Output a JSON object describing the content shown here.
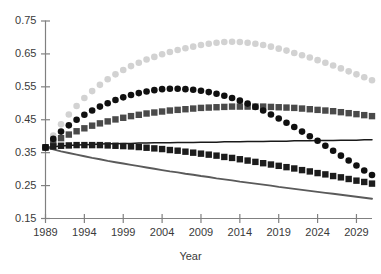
{
  "chart_data": {
    "type": "line",
    "title": "",
    "subtitle": "",
    "xlabel": "Year",
    "ylabel": "",
    "xlim": [
      1989,
      2031
    ],
    "ylim": [
      0.15,
      0.75
    ],
    "xticks": [
      1989,
      1994,
      1999,
      2004,
      2009,
      2014,
      2019,
      2024,
      2029
    ],
    "yticks": [
      0.15,
      0.25,
      0.35,
      0.45,
      0.55,
      0.65,
      0.75
    ],
    "xtick_labels": [
      "1989",
      "1994",
      "1999",
      "2004",
      "2009",
      "2014",
      "2019",
      "2024",
      "2029"
    ],
    "ytick_labels": [
      "0.15",
      "0.25",
      "0.35",
      "0.45",
      "0.55",
      "0.65",
      "0.75"
    ],
    "grid": false,
    "legend": "none",
    "x": [
      1989,
      1990,
      1991,
      1992,
      1993,
      1994,
      1995,
      1996,
      1997,
      1998,
      1999,
      2000,
      2001,
      2002,
      2003,
      2004,
      2005,
      2006,
      2007,
      2008,
      2009,
      2010,
      2011,
      2012,
      2013,
      2014,
      2015,
      2016,
      2017,
      2018,
      2019,
      2020,
      2021,
      2022,
      2023,
      2024,
      2025,
      2026,
      2027,
      2028,
      2029,
      2030,
      2031
    ],
    "series": [
      {
        "name": "light-gray-circles",
        "marker": "circle",
        "color": "#d2d2d2",
        "line": false,
        "values": [
          0.366,
          0.402,
          0.436,
          0.466,
          0.492,
          0.516,
          0.537,
          0.556,
          0.573,
          0.588,
          0.601,
          0.613,
          0.623,
          0.633,
          0.641,
          0.649,
          0.656,
          0.662,
          0.667,
          0.672,
          0.677,
          0.681,
          0.684,
          0.686,
          0.687,
          0.686,
          0.684,
          0.681,
          0.677,
          0.672,
          0.666,
          0.66,
          0.653,
          0.646,
          0.639,
          0.631,
          0.623,
          0.615,
          0.606,
          0.597,
          0.588,
          0.579,
          0.57
        ]
      },
      {
        "name": "black-circles",
        "marker": "circle",
        "color": "#101010",
        "line": false,
        "values": [
          0.366,
          0.392,
          0.414,
          0.433,
          0.45,
          0.465,
          0.478,
          0.49,
          0.5,
          0.51,
          0.518,
          0.525,
          0.531,
          0.536,
          0.54,
          0.543,
          0.544,
          0.544,
          0.543,
          0.541,
          0.538,
          0.534,
          0.529,
          0.523,
          0.516,
          0.508,
          0.499,
          0.489,
          0.478,
          0.466,
          0.454,
          0.441,
          0.428,
          0.414,
          0.4,
          0.386,
          0.371,
          0.356,
          0.341,
          0.326,
          0.311,
          0.296,
          0.282
        ]
      },
      {
        "name": "dark-gray-squares",
        "marker": "square",
        "color": "#4a4a4a",
        "line": false,
        "values": [
          0.366,
          0.381,
          0.394,
          0.405,
          0.415,
          0.424,
          0.432,
          0.439,
          0.445,
          0.451,
          0.456,
          0.461,
          0.465,
          0.469,
          0.472,
          0.475,
          0.478,
          0.48,
          0.482,
          0.484,
          0.486,
          0.487,
          0.488,
          0.489,
          0.49,
          0.49,
          0.49,
          0.49,
          0.49,
          0.489,
          0.488,
          0.487,
          0.486,
          0.484,
          0.482,
          0.48,
          0.478,
          0.476,
          0.473,
          0.47,
          0.467,
          0.464,
          0.461
        ]
      },
      {
        "name": "black-squares",
        "marker": "square",
        "color": "#1c1c1c",
        "line": false,
        "values": [
          0.366,
          0.369,
          0.371,
          0.372,
          0.373,
          0.373,
          0.373,
          0.373,
          0.372,
          0.371,
          0.37,
          0.369,
          0.367,
          0.365,
          0.363,
          0.361,
          0.358,
          0.356,
          0.353,
          0.35,
          0.347,
          0.344,
          0.341,
          0.337,
          0.334,
          0.33,
          0.326,
          0.322,
          0.318,
          0.314,
          0.31,
          0.306,
          0.302,
          0.297,
          0.293,
          0.288,
          0.284,
          0.279,
          0.275,
          0.27,
          0.265,
          0.261,
          0.256
        ]
      },
      {
        "name": "thin-black-line",
        "marker": "none",
        "color": "#1a1a1a",
        "line": true,
        "values": [
          0.366,
          0.368,
          0.37,
          0.372,
          0.373,
          0.374,
          0.375,
          0.376,
          0.377,
          0.377,
          0.378,
          0.378,
          0.379,
          0.379,
          0.38,
          0.38,
          0.38,
          0.381,
          0.381,
          0.381,
          0.382,
          0.382,
          0.382,
          0.383,
          0.383,
          0.383,
          0.384,
          0.384,
          0.384,
          0.385,
          0.385,
          0.385,
          0.386,
          0.386,
          0.386,
          0.387,
          0.387,
          0.387,
          0.388,
          0.388,
          0.388,
          0.389,
          0.389
        ]
      },
      {
        "name": "medium-gray-line",
        "marker": "none",
        "color": "#5a5a5a",
        "line": true,
        "values": [
          0.366,
          0.36,
          0.354,
          0.349,
          0.344,
          0.339,
          0.334,
          0.33,
          0.325,
          0.321,
          0.317,
          0.313,
          0.309,
          0.305,
          0.301,
          0.297,
          0.293,
          0.29,
          0.286,
          0.283,
          0.279,
          0.276,
          0.272,
          0.269,
          0.266,
          0.262,
          0.259,
          0.256,
          0.253,
          0.25,
          0.246,
          0.243,
          0.24,
          0.237,
          0.234,
          0.231,
          0.228,
          0.225,
          0.222,
          0.219,
          0.216,
          0.213,
          0.21
        ]
      }
    ]
  },
  "axis": {
    "x_title": "Year"
  }
}
